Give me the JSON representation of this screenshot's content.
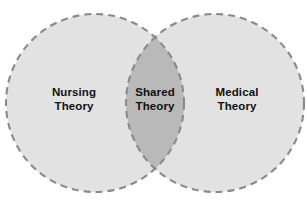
{
  "diagram": {
    "type": "venn",
    "title": "",
    "background_color": "#ffffff",
    "sets": [
      {
        "id": "left",
        "name": "nursing-theory",
        "line1": "Nursing",
        "line2": "Theory",
        "fill_color": "#e2e2e2",
        "stroke_color": "#8a8a8a",
        "stroke_style": "dashed",
        "center_x": 95,
        "center_y": 103,
        "radius": 89
      },
      {
        "id": "right",
        "name": "medical-theory",
        "line1": "Medical",
        "line2": "Theory",
        "fill_color": "#e2e2e2",
        "stroke_color": "#8a8a8a",
        "stroke_style": "dashed",
        "center_x": 215,
        "center_y": 103,
        "radius": 89
      }
    ],
    "intersection": {
      "id": "center",
      "name": "shared-theory",
      "line1": "Shared",
      "line2": "Theory",
      "fill_color": "#b9b9b9"
    },
    "text_color": "#111111"
  }
}
